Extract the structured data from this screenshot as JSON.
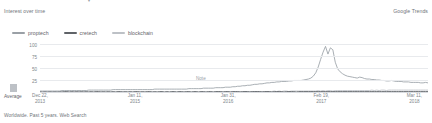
{
  "header": {
    "section_title": "Interest over time",
    "brand": "Google Trends",
    "top_clip_glyph": "▾"
  },
  "legend": {
    "position": "top-left",
    "items": [
      {
        "label": "proptech",
        "color": "#9aa0a6"
      },
      {
        "label": "cretech",
        "color": "#5f6368"
      },
      {
        "label": "blockchain",
        "color": "#bdc1c6"
      }
    ]
  },
  "average": {
    "label": "Average",
    "swatch_color": "#bdc1c6"
  },
  "annotation": {
    "label": "Note"
  },
  "footer": {
    "text": "Worldwide. Past 5 years. Web Search"
  },
  "chart_data": {
    "type": "line",
    "title": "Interest over time",
    "xlabel": "",
    "ylabel": "",
    "ylim": [
      0,
      100
    ],
    "yticks": [
      100,
      75,
      50,
      25
    ],
    "grid": true,
    "legend_position": "top-left",
    "xtick_labels": [
      {
        "date_line1": "Dec 22,",
        "date_line2": "2013",
        "pos_pct": 0
      },
      {
        "date_line1": "Jan 11,",
        "date_line2": "2015",
        "pos_pct": 24.5
      },
      {
        "date_line1": "Jan 31,",
        "date_line2": "2016",
        "pos_pct": 48.5
      },
      {
        "date_line1": "Feb 19,",
        "date_line2": "2017",
        "pos_pct": 72.5
      },
      {
        "date_line1": "Mar 11,",
        "date_line2": "2018",
        "pos_pct": 96.5
      }
    ],
    "series": [
      {
        "name": "blockchain",
        "color": "#9aa0a6",
        "values": [
          2,
          2,
          2,
          2,
          2,
          2,
          2,
          2,
          2,
          3,
          3,
          3,
          3,
          3,
          3,
          3,
          3,
          3,
          3,
          3,
          4,
          4,
          4,
          4,
          4,
          4,
          4,
          4,
          4,
          4,
          5,
          5,
          5,
          5,
          5,
          5,
          5,
          5,
          5,
          5,
          5,
          5,
          5,
          5,
          5,
          5,
          5,
          6,
          6,
          6,
          6,
          6,
          6,
          6,
          6,
          6,
          6,
          6,
          6,
          6,
          6,
          7,
          7,
          7,
          7,
          7,
          7,
          8,
          8,
          8,
          8,
          8,
          9,
          9,
          9,
          9,
          10,
          10,
          10,
          11,
          11,
          12,
          12,
          13,
          13,
          14,
          14,
          15,
          16,
          16,
          17,
          17,
          18,
          19,
          19,
          20,
          20,
          21,
          21,
          22,
          22,
          22,
          23,
          23,
          24,
          24,
          24,
          24,
          25,
          26,
          27,
          29,
          33,
          40,
          52,
          68,
          83,
          95,
          79,
          92,
          88,
          62,
          48,
          42,
          38,
          35,
          33,
          32,
          31,
          30,
          29,
          31,
          30,
          28,
          27,
          27,
          26,
          26,
          25,
          25,
          24,
          24,
          23,
          23,
          24,
          23,
          22,
          22,
          22,
          21,
          21,
          21,
          20,
          20,
          20,
          20,
          19,
          19,
          20,
          19
        ]
      },
      {
        "name": "cretech",
        "color": "#5f6368",
        "values": [
          1,
          0,
          1,
          0,
          1,
          0,
          1,
          0,
          1,
          0,
          1,
          1,
          0,
          1,
          0,
          1,
          0,
          1,
          0,
          1,
          0,
          1,
          0,
          1,
          1,
          0,
          1,
          0,
          1,
          0,
          1,
          0,
          1,
          1,
          0,
          1,
          0,
          1,
          0,
          1,
          1,
          0,
          1,
          0,
          1,
          1,
          0,
          1,
          0,
          1,
          1,
          0,
          1,
          0,
          1,
          1,
          0,
          1,
          1,
          0,
          1,
          1,
          0,
          1,
          1,
          0,
          1,
          1,
          0,
          1,
          1,
          0,
          1,
          1,
          1,
          0,
          1,
          1,
          0,
          1,
          1,
          1,
          0,
          1,
          1,
          1,
          0,
          1,
          1,
          1,
          1,
          0,
          1,
          1,
          1,
          0,
          1,
          1,
          1,
          1,
          0,
          1,
          1,
          1,
          1,
          0,
          1,
          1,
          1,
          1,
          1,
          1,
          1,
          1,
          1,
          1,
          1,
          1,
          1,
          1,
          1,
          1,
          1,
          1,
          1,
          1,
          1,
          1,
          1,
          1,
          1,
          1,
          1,
          1,
          1,
          1,
          1,
          1,
          1,
          1,
          1,
          1,
          1,
          1,
          1,
          1,
          1,
          1,
          1,
          1,
          1,
          1,
          1,
          1,
          1,
          1,
          1,
          1,
          1,
          1
        ]
      },
      {
        "name": "proptech",
        "color": "#bdc1c6",
        "values": [
          0,
          0,
          0,
          0,
          0,
          0,
          0,
          0,
          0,
          0,
          0,
          0,
          0,
          0,
          0,
          0,
          0,
          0,
          0,
          0,
          0,
          0,
          0,
          0,
          0,
          0,
          0,
          0,
          0,
          0,
          0,
          0,
          0,
          0,
          0,
          0,
          0,
          0,
          0,
          0,
          0,
          0,
          0,
          0,
          0,
          0,
          0,
          0,
          0,
          0,
          0,
          0,
          0,
          0,
          0,
          0,
          0,
          0,
          0,
          0,
          0,
          0,
          0,
          0,
          0,
          0,
          0,
          0,
          0,
          0,
          0,
          0,
          1,
          0,
          1,
          0,
          1,
          0,
          1,
          1,
          0,
          1,
          1,
          0,
          1,
          1,
          1,
          1,
          1,
          1,
          1,
          1,
          1,
          1,
          1,
          1,
          2,
          1,
          2,
          1,
          2,
          2,
          1,
          2,
          2,
          2,
          2,
          2,
          2,
          2,
          2,
          2,
          2,
          2,
          3,
          2,
          3,
          2,
          3,
          3,
          2,
          3,
          3,
          3,
          3,
          3,
          3,
          3,
          3,
          3,
          3,
          3,
          3,
          3,
          3,
          3,
          4,
          3,
          4,
          3,
          4,
          4,
          3,
          4,
          4,
          4,
          4,
          4,
          4,
          4,
          4,
          4,
          4,
          4,
          4,
          4,
          4,
          4,
          4,
          4
        ]
      }
    ]
  }
}
